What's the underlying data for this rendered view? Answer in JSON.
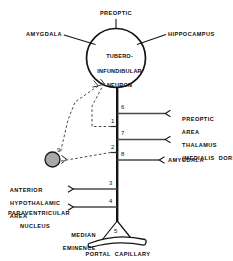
{
  "diagram": {
    "soma": {
      "label": "TUBERO-\nINFUNDIBULAR\nNEURON",
      "line1": "TUBERO-",
      "line2": "INFUNDIBULAR",
      "line3": "NEURON"
    },
    "top_inputs": [
      {
        "id": "preoptic",
        "label": "PREOPTIC"
      },
      {
        "id": "amygdala-top",
        "label": "AMYGDALA"
      },
      {
        "id": "hippocampus",
        "label": "HIPPOCAMPUS"
      }
    ],
    "right_branches": [
      {
        "number": "6",
        "label": "PREOPTIC\nAREA",
        "line1": "PREOPTIC",
        "line2": "AREA"
      },
      {
        "number": "7",
        "label": "THALAMUS\n(MEDIALIS DORSALIS)",
        "line1": "THALAMUS",
        "line2": "(MEDIALIS  DORSALIS)"
      },
      {
        "number": "8",
        "label": "AMYGDALA",
        "line1": "AMYGDALA",
        "line2": ""
      }
    ],
    "left_branches": [
      {
        "number": "3",
        "label": "ANTERIOR\nHYPOTHALAMIC\nAREA",
        "line1": "ANTERIOR",
        "line2": "HYPOTHALAMIC",
        "line3": "AREA"
      },
      {
        "number": "4",
        "label": "PARAVENTRICULAR\nNUCLEUS",
        "line1": "PARAVENTRICULAR",
        "line2": "NUCLEUS",
        "line3": ""
      }
    ],
    "axon_ticks": [
      {
        "number": "1"
      },
      {
        "number": "2"
      }
    ],
    "feedback": {
      "number": "9",
      "node_color": "#a8a8a8"
    },
    "terminal": {
      "number": "5",
      "median_eminence_label": "MEDIAN\nEMINENCE",
      "median_eminence_line1": "MEDIAN",
      "median_eminence_line2": "EMINENCE",
      "portal_capillary_label": "PORTAL  CAPILLARY"
    },
    "colors": {
      "ink": "#111111",
      "stroke": "#1a1a1a",
      "node_fill": "#a8a8a8",
      "background": "#ffffff"
    }
  }
}
